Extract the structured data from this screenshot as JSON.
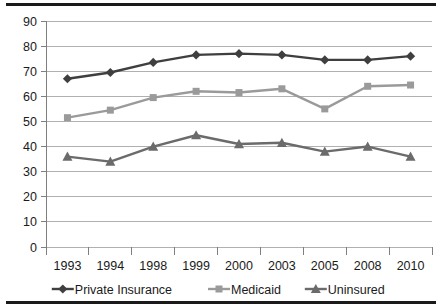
{
  "chart_data": {
    "type": "line",
    "title": "",
    "subtitle": "",
    "xlabel": "",
    "ylabel": "",
    "categories": [
      "1993",
      "1994",
      "1998",
      "1999",
      "2000",
      "2003",
      "2005",
      "2008",
      "2010"
    ],
    "ylim": [
      0,
      90
    ],
    "yticks": [
      "0",
      "10",
      "20",
      "30",
      "40",
      "50",
      "60",
      "70",
      "80",
      "90"
    ],
    "ytick_values": [
      0,
      10,
      20,
      30,
      40,
      50,
      60,
      70,
      80,
      90
    ],
    "grid": "horizontal",
    "legend_position": "bottom",
    "series": [
      {
        "name": "Private Insurance",
        "marker": "diamond",
        "color": "#3f3f3f",
        "values": [
          67,
          69.5,
          73.5,
          76.5,
          77,
          76.5,
          74.5,
          74.5,
          76
        ]
      },
      {
        "name": "Medicaid",
        "marker": "square",
        "color": "#9a9a9a",
        "values": [
          51.5,
          54.5,
          59.5,
          62,
          61.5,
          63,
          55,
          64,
          64.5
        ]
      },
      {
        "name": "Uninsured",
        "marker": "triangle",
        "color": "#6b6b6b",
        "values": [
          36,
          34,
          40,
          44.5,
          41,
          41.5,
          38,
          40,
          36
        ]
      }
    ]
  },
  "style": {
    "gridline_color": "#b0b0b0",
    "axis_color": "#7f7f7f",
    "rule_color": "#1a1a1a",
    "background": "#ffffff",
    "text_color": "#1a1a1a"
  }
}
